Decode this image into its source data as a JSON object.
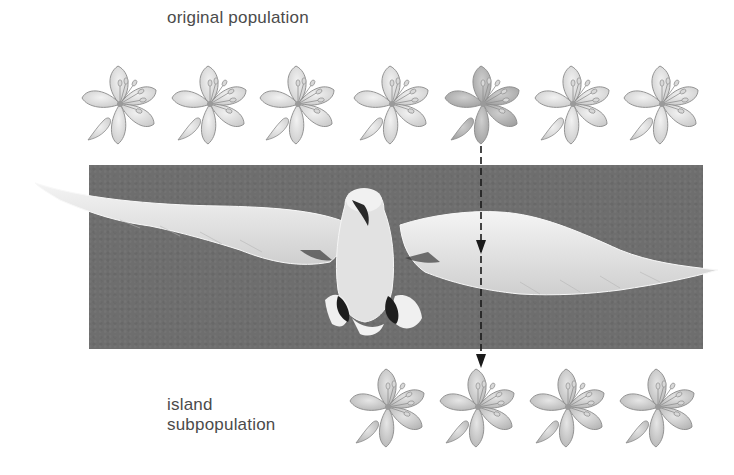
{
  "labels": {
    "original_population": "original population",
    "island_line1": "island",
    "island_line2": "subpopulation"
  },
  "original_population": {
    "count": 7,
    "flowers": [
      {
        "x": 80,
        "shade": "light"
      },
      {
        "x": 170,
        "shade": "light"
      },
      {
        "x": 258,
        "shade": "light"
      },
      {
        "x": 352,
        "shade": "light"
      },
      {
        "x": 443,
        "shade": "dark",
        "migrant": true
      },
      {
        "x": 533,
        "shade": "light"
      },
      {
        "x": 622,
        "shade": "light"
      }
    ]
  },
  "island_subpopulation": {
    "count": 4,
    "flowers": [
      {
        "x": 348,
        "shade": "medium"
      },
      {
        "x": 438,
        "shade": "medium"
      },
      {
        "x": 528,
        "shade": "medium"
      },
      {
        "x": 618,
        "shade": "medium"
      }
    ]
  },
  "colors": {
    "background": "#ffffff",
    "sky": "#6e6e6e",
    "bird": "#e9e9e9",
    "flower_light": "#dcdcdc",
    "flower_dark": "#b9b9b9",
    "flower_outline": "#8a8a8a",
    "arrow": "#1a1a1a",
    "text": "#4b4b4b"
  },
  "arrow": {
    "style": "dashed",
    "from": "original_population.flowers.4",
    "to": "island_subpopulation.flowers.1",
    "x": 481,
    "y_start": 146,
    "y_end": 368
  }
}
